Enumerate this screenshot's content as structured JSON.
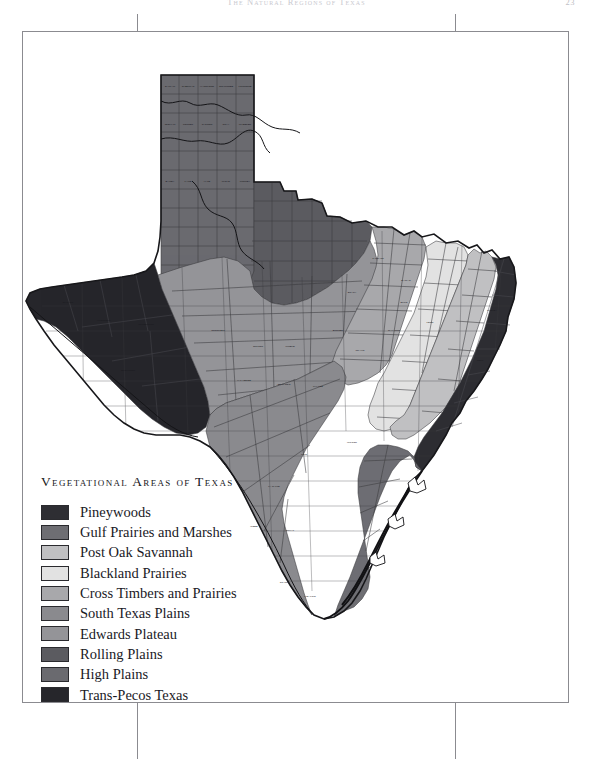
{
  "page": {
    "running_head": "The Natural Regions of Texas",
    "folio": "23",
    "background_color": "#ffffff",
    "trim_border_color": "#8b8b90"
  },
  "legend": {
    "title": "Vegetational Areas of Texas",
    "items": [
      {
        "label": "Pineywoods",
        "color": "#2e2e33"
      },
      {
        "label": "Gulf Prairies and Marshes",
        "color": "#6e6e73"
      },
      {
        "label": "Post Oak Savannah",
        "color": "#c0c0c2"
      },
      {
        "label": "Blackland Prairies",
        "color": "#e2e2e2"
      },
      {
        "label": "Cross Timbers and Prairies",
        "color": "#a8a8ab"
      },
      {
        "label": "South Texas Plains",
        "color": "#8a8a8e"
      },
      {
        "label": "Edwards Plateau",
        "color": "#949498"
      },
      {
        "label": "Rolling Plains",
        "color": "#5b5b60"
      },
      {
        "label": "High Plains",
        "color": "#6a6a6f"
      },
      {
        "label": "Trans-Pecos Texas",
        "color": "#26262b"
      }
    ]
  },
  "map": {
    "title": "Texas counties shaded by vegetational area",
    "county_line_color": "#3a3a3e",
    "outline_color": "#17171a",
    "coast_line_color": "#111114",
    "regions": [
      {
        "name": "Pineywoods",
        "color": "#2e2e33",
        "location": "East Texas"
      },
      {
        "name": "Gulf Prairies and Marshes",
        "color": "#6e6e73",
        "location": "Gulf Coast"
      },
      {
        "name": "Post Oak Savannah",
        "color": "#c0c0c2",
        "location": "East-Central Texas"
      },
      {
        "name": "Blackland Prairies",
        "color": "#e2e2e2",
        "location": "Central Texas band"
      },
      {
        "name": "Cross Timbers and Prairies",
        "color": "#a8a8ab",
        "location": "North-Central Texas"
      },
      {
        "name": "South Texas Plains",
        "color": "#8a8a8e",
        "location": "South Texas"
      },
      {
        "name": "Edwards Plateau",
        "color": "#949498",
        "location": "Central West Texas"
      },
      {
        "name": "Rolling Plains",
        "color": "#5b5b60",
        "location": "Northwest Texas"
      },
      {
        "name": "High Plains",
        "color": "#6a6a6f",
        "location": "Panhandle"
      },
      {
        "name": "Trans-Pecos Texas",
        "color": "#26262b",
        "location": "Far West Texas"
      }
    ],
    "county_labels": [
      "DALLAM",
      "SHERMAN",
      "HANSFORD",
      "OCHILTREE",
      "LIPSCOMB",
      "HARTLEY",
      "MOORE",
      "HUTCHINSON",
      "ROBERTS",
      "HEMPHILL",
      "OLDHAM",
      "POTTER",
      "CARSON",
      "GRAY",
      "WHEELER",
      "DEAF SMITH",
      "RANDALL",
      "ARMSTRONG",
      "DONLEY",
      "COLLINGSWORTH",
      "PARMER",
      "CASTRO",
      "SWISHER",
      "BRISCOE",
      "HALL",
      "CHILDRESS",
      "BAILEY",
      "LAMB",
      "HALE",
      "FLOYD",
      "MOTLEY",
      "COTTLE",
      "COCHRAN",
      "HOCKLEY",
      "LUBBOCK",
      "CROSBY",
      "DICKENS",
      "KING",
      "KNOX",
      "BAYLOR",
      "ARCHER",
      "YOAKUM",
      "TERRY",
      "LYNN",
      "GARZA",
      "KENT",
      "STONEWALL",
      "HASKELL",
      "THROCKMORTON",
      "YOUNG",
      "JACK",
      "WISE",
      "DENTON",
      "COLLIN",
      "HUNT",
      "GAINES",
      "DAWSON",
      "BORDEN",
      "SCURRY",
      "FISHER",
      "JONES",
      "SHACKELFORD",
      "STEPHENS",
      "PALO PINTO",
      "PARKER",
      "TARRANT",
      "DALLAS",
      "KAUFMAN",
      "VAN ZANDT",
      "ANDREWS",
      "MARTIN",
      "HOWARD",
      "MITCHELL",
      "NOLAN",
      "TAYLOR",
      "CALLAHAN",
      "EASTLAND",
      "ERATH",
      "HOOD",
      "JOHNSON",
      "ELLIS",
      "HENDERSON",
      "EL PASO",
      "HUDSPETH",
      "CULBERSON",
      "REEVES",
      "LOVING",
      "WINKLER",
      "ECTOR",
      "MIDLAND",
      "GLASSCOCK",
      "STERLING",
      "COKE",
      "RUNNELS",
      "COLEMAN",
      "BROWN",
      "COMANCHE",
      "BOSQUE",
      "HILL",
      "NAVARRO",
      "JEFF DAVIS",
      "PRESIDIO",
      "BREWSTER",
      "PECOS",
      "CRANE",
      "UPTON",
      "REAGAN",
      "IRION",
      "TOM GREEN",
      "CONCHO",
      "MCCULLOCH",
      "SAN SABA",
      "MILLS",
      "HAMILTON",
      "CORYELL",
      "MCLENNAN",
      "LIMESTONE",
      "FREESTONE",
      "TERRELL",
      "CROCKETT",
      "SCHLEICHER",
      "MENARD",
      "MASON",
      "LLANO",
      "BURNET",
      "LAMPASAS",
      "BELL",
      "FALLS",
      "LEON",
      "HOUSTON",
      "VAL VERDE",
      "SUTTON",
      "KIMBLE",
      "GILLESPIE",
      "BLANCO",
      "TRAVIS",
      "WILLIAMSON",
      "MILAM",
      "ROBERTSON",
      "MADISON",
      "WALKER",
      "EDWARDS",
      "KINNEY",
      "UVALDE",
      "REAL",
      "BANDERA",
      "KERR",
      "KENDALL",
      "COMAL",
      "HAYS",
      "BASTROP",
      "LEE",
      "BURLESON",
      "BRAZOS",
      "GRIMES",
      "MONTGOMERY",
      "MAVERICK",
      "ZAVALA",
      "FRIO",
      "MEDINA",
      "BEXAR",
      "GUADALUPE",
      "CALDWELL",
      "FAYETTE",
      "AUSTIN",
      "WALLER",
      "HARRIS",
      "LIBERTY",
      "CHAMBERS",
      "DIMMIT",
      "LA SALLE",
      "MCMULLEN",
      "LIVE OAK",
      "ATASCOSA",
      "WILSON",
      "KARNES",
      "DEWITT",
      "LAVACA",
      "COLORADO",
      "FORT BEND",
      "BRAZORIA",
      "GALVESTON",
      "MATAGORDA",
      "WEBB",
      "DUVAL",
      "JIM WELLS",
      "NUECES",
      "SAN PATRICIO",
      "REFUGIO",
      "GOLIAD",
      "VICTORIA",
      "JACKSON",
      "CALHOUN",
      "ARANSAS",
      "ZAPATA",
      "JIM HOGG",
      "BROOKS",
      "KENEDY",
      "KLEBERG",
      "STARR",
      "HIDALGO",
      "WILLACY",
      "CAMERON",
      "BOWIE",
      "RED RIVER",
      "LAMAR",
      "FANNIN",
      "GRAYSON",
      "COOKE",
      "MONTAGUE",
      "CLAY",
      "WICHITA",
      "WILBARGER",
      "HARDEMAN",
      "FOARD",
      "TITUS",
      "MORRIS",
      "CASS",
      "MARION",
      "HARRISON",
      "PANOLA",
      "SHELBY",
      "SABINE",
      "SAN AUGUSTINE",
      "NACOGDOCHES",
      "RUSK",
      "GREGG",
      "UPSHUR",
      "CAMP",
      "FRANKLIN",
      "HOPKINS",
      "DELTA",
      "RAINS",
      "WOOD",
      "SMITH",
      "CHEROKEE",
      "ANGELINA",
      "TRINITY",
      "POLK",
      "TYLER",
      "JASPER",
      "NEWTON",
      "HARDIN",
      "ORANGE",
      "JEFFERSON"
    ]
  }
}
